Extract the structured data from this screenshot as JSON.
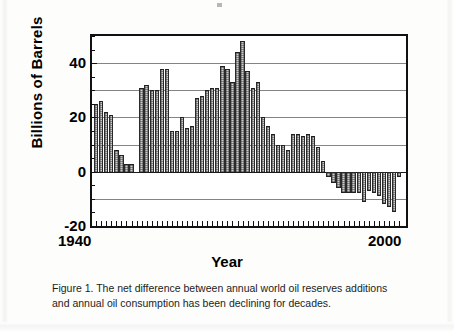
{
  "figure": {
    "caption_line_1": "Figure 1.  The net difference between annual world oil reserves additions",
    "caption_line_2": "and annual oil consumption has been declining for decades."
  },
  "chart_data": {
    "type": "bar",
    "title": "",
    "xlabel": "Year",
    "ylabel": "Billions of Barrels",
    "ylim": [
      -20,
      50
    ],
    "yticks": [
      -20,
      0,
      20,
      40
    ],
    "ytick_labels": [
      "-20",
      "0",
      "20",
      "40"
    ],
    "gridlines": [
      -10,
      10,
      30,
      40
    ],
    "grid": true,
    "legend": null,
    "xlim": [
      1939,
      2001
    ],
    "xticks": [
      1940,
      2000
    ],
    "xtick_labels": [
      "1940",
      "2000"
    ],
    "bar_color": "#cdcdcd",
    "bar_edge_color": "#2a2a2a",
    "axis_color": "#111111",
    "x": [
      1940,
      1941,
      1942,
      1943,
      1944,
      1945,
      1946,
      1947,
      1948,
      1949,
      1950,
      1951,
      1952,
      1953,
      1954,
      1955,
      1956,
      1957,
      1958,
      1959,
      1960,
      1961,
      1962,
      1963,
      1964,
      1965,
      1966,
      1967,
      1968,
      1969,
      1970,
      1971,
      1972,
      1973,
      1974,
      1975,
      1976,
      1977,
      1978,
      1979,
      1980,
      1981,
      1982,
      1983,
      1984,
      1985,
      1986,
      1987,
      1988,
      1989,
      1990,
      1991,
      1992,
      1993,
      1994,
      1995,
      1996,
      1997,
      1998,
      1999,
      2000
    ],
    "values": [
      25,
      26,
      22,
      21,
      8,
      6,
      3,
      3,
      0,
      31,
      32,
      30,
      30,
      38,
      38,
      15,
      15,
      20,
      16,
      17,
      27,
      28,
      30,
      31,
      31,
      39,
      38,
      33,
      44,
      48,
      37,
      31,
      33,
      20,
      17,
      14,
      10,
      10,
      8,
      14,
      14,
      13,
      14,
      13,
      9,
      4,
      -2,
      -4,
      -6,
      -8,
      -8,
      -8,
      -8,
      -11,
      -7,
      -8,
      -9,
      -12,
      -13,
      -15,
      -2
    ]
  }
}
